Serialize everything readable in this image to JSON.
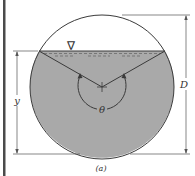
{
  "figure": {
    "caption": "(a)",
    "labels": {
      "depth": "y",
      "diameter": "D",
      "angle": "θ",
      "water_surface_symbol": "∇"
    },
    "colors": {
      "water_fill": "#a9a9a9",
      "outline": "#3a3a3a",
      "dimension_line": "#555555",
      "border_bar": "#4a4a4a",
      "background": "#ffffff"
    }
  }
}
